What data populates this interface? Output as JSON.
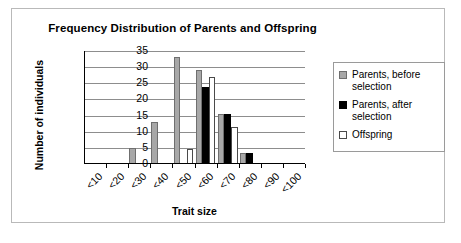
{
  "chart_data": {
    "type": "bar",
    "title": "Frequency Distribution of Parents and Offspring",
    "xlabel": "Trait size",
    "ylabel": "Number of individuals",
    "categories": [
      "<10",
      "<20",
      "<30",
      "<40",
      "<50",
      "<60",
      "<70",
      "<80",
      "<90",
      "<100"
    ],
    "yticks": [
      0,
      5,
      10,
      15,
      20,
      25,
      30,
      35
    ],
    "ylim": [
      0,
      35
    ],
    "grid": true,
    "legend_position": "right",
    "series": [
      {
        "name": "Parents, before selection",
        "color": "#a8a8a8",
        "values": [
          0,
          0,
          5,
          13,
          33,
          29,
          15.5,
          3.5,
          0,
          0
        ]
      },
      {
        "name": "Parents, after selection",
        "color": "#000000",
        "values": [
          0,
          0,
          0,
          0,
          0,
          24,
          15.5,
          3.5,
          0,
          0
        ]
      },
      {
        "name": "Offspring",
        "color": "#ffffff",
        "values": [
          0,
          0,
          0,
          0,
          4.5,
          27,
          11.5,
          0,
          0,
          0
        ]
      }
    ]
  },
  "legend": {
    "items": [
      {
        "label": "Parents, before selection"
      },
      {
        "label": "Parents, after selection"
      },
      {
        "label": "Offspring"
      }
    ]
  }
}
